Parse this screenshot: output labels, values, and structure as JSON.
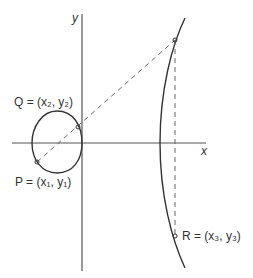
{
  "diagram": {
    "type": "elliptic-curve-point-addition",
    "axes": {
      "x_label": "x",
      "y_label": "y"
    },
    "points": {
      "P": {
        "name": "P",
        "label": "P = (x₁, y₁)"
      },
      "Q": {
        "name": "Q",
        "label": "Q = (x₂, y₂)"
      },
      "R": {
        "name": "R",
        "label": "R = (x₃, y₃)"
      }
    },
    "colors": {
      "curve": "#333333",
      "axis": "#555555",
      "dashed": "#666666",
      "text": "#333333",
      "background": "#ffffff"
    }
  }
}
